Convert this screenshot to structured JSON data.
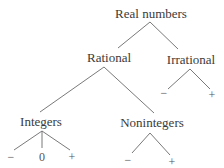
{
  "diagram": {
    "type": "tree",
    "root": {
      "label": "Real numbers",
      "children": [
        {
          "label": "Rational",
          "children": [
            {
              "label": "Integers",
              "children": [
                {
                  "label": "−"
                },
                {
                  "label": "0"
                },
                {
                  "label": "+"
                }
              ]
            },
            {
              "label": "Nonintegers",
              "children": [
                {
                  "label": "−"
                },
                {
                  "label": "+"
                }
              ]
            }
          ]
        },
        {
          "label": "Irrational",
          "children": [
            {
              "label": "−"
            },
            {
              "label": "+"
            }
          ]
        }
      ]
    },
    "nodes": {
      "real": "Real numbers",
      "rational": "Rational",
      "irrational": "Irrational",
      "integers": "Integers",
      "nonintegers": "Nonintegers",
      "irrational_neg": "−",
      "irrational_pos": "+",
      "integers_neg": "−",
      "integers_zero": "0",
      "integers_pos": "+",
      "nonintegers_neg": "−",
      "nonintegers_pos": "+"
    }
  }
}
